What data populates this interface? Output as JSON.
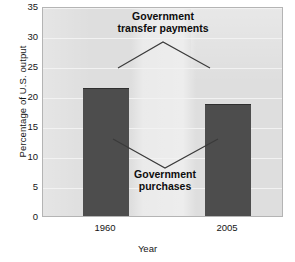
{
  "chart_data": {
    "type": "bar",
    "title": "",
    "xlabel": "Year",
    "ylabel": "Percentage of U.S. output",
    "categories": [
      "1960",
      "2005"
    ],
    "values": [
      21.6,
      19.0
    ],
    "series": [
      {
        "name": "Government purchases",
        "values": [
          21.6,
          19.0
        ]
      }
    ],
    "ylim": [
      0,
      35
    ],
    "yticks": [
      0,
      5,
      10,
      15,
      20,
      25,
      30,
      35
    ],
    "ytick_labels": [
      "0",
      "5",
      "10",
      "15",
      "20",
      "25",
      "30",
      "35"
    ],
    "grid": true,
    "legend_position": "none",
    "annotations": [
      {
        "id": "transfer",
        "text": "Government\ntransfer payments",
        "points_to": "plot-background-region"
      },
      {
        "id": "purchases",
        "text": "Government\npurchases",
        "points_to": "dark-bars"
      }
    ],
    "colors": {
      "bar": "#4d4d4d",
      "plot_background": "#dedede",
      "gridline": "#f2f2f2",
      "text": "#161616",
      "leader_line": "#3a3a3a"
    }
  },
  "axes": {
    "y_title": "Percentage of U.S. output",
    "x_title": "Year"
  },
  "annotations": {
    "transfer_label": "Government\ntransfer payments",
    "purchases_label": "Government\npurchases"
  }
}
